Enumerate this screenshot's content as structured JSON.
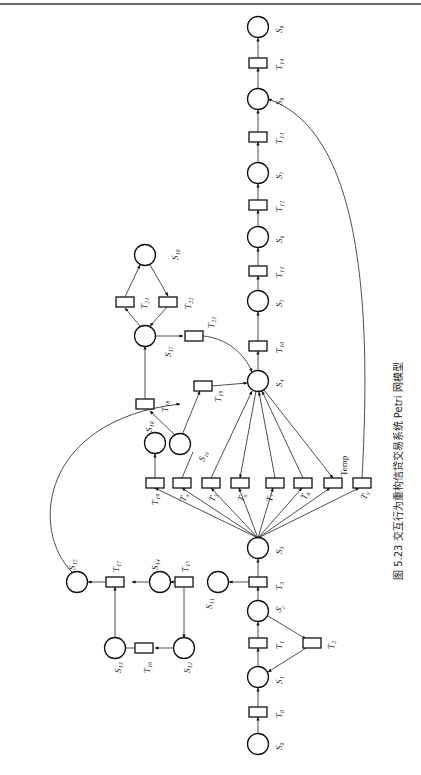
{
  "header": {
    "running_text": ""
  },
  "figure": {
    "caption": "图 5.23 交互行为重构信贷交易系统 Petri 网模型",
    "orientation": "rotated-90-ccw",
    "places": [
      {
        "id": "S0",
        "label": "S₀"
      },
      {
        "id": "S1",
        "label": "S₁"
      },
      {
        "id": "S2",
        "label": "S₂"
      },
      {
        "id": "S3",
        "label": "S₃"
      },
      {
        "id": "S4",
        "label": "S₄"
      },
      {
        "id": "S5",
        "label": "S₅"
      },
      {
        "id": "S6",
        "label": "S₆"
      },
      {
        "id": "S7",
        "label": "S₇"
      },
      {
        "id": "S8",
        "label": "S₈"
      },
      {
        "id": "S9",
        "label": "S₉"
      },
      {
        "id": "S10",
        "label": "S₁₀"
      },
      {
        "id": "S11",
        "label": "S₁₁"
      },
      {
        "id": "S12",
        "label": "S₁₂"
      },
      {
        "id": "S13",
        "label": "S₁₃"
      },
      {
        "id": "S14",
        "label": "S₁₄"
      },
      {
        "id": "S15",
        "label": "S₁₅"
      },
      {
        "id": "S16",
        "label": "S₁₆"
      },
      {
        "id": "S17",
        "label": "S₁₇"
      },
      {
        "id": "S18",
        "label": "S₁₈"
      }
    ],
    "transitions": [
      {
        "id": "T0",
        "label": "T₀"
      },
      {
        "id": "T1",
        "label": "T₁"
      },
      {
        "id": "T2",
        "label": "T₂"
      },
      {
        "id": "T3",
        "label": "T₃"
      },
      {
        "id": "T4",
        "label": "T₄"
      },
      {
        "id": "T5",
        "label": "T₅"
      },
      {
        "id": "T6",
        "label": "T₆"
      },
      {
        "id": "T7",
        "label": "T₇"
      },
      {
        "id": "T8",
        "label": "T₈"
      },
      {
        "id": "Temp",
        "label": "Temp"
      },
      {
        "id": "T9",
        "label": "T₉"
      },
      {
        "id": "T10",
        "label": "T₁₀"
      },
      {
        "id": "T11",
        "label": "T₁₁"
      },
      {
        "id": "T12",
        "label": "T₁₂"
      },
      {
        "id": "T13",
        "label": "T₁₃"
      },
      {
        "id": "T14",
        "label": "T₁₄"
      },
      {
        "id": "T15",
        "label": "T₁₅"
      },
      {
        "id": "T16",
        "label": "T₁₆"
      },
      {
        "id": "T17",
        "label": "T₁₇"
      },
      {
        "id": "T18",
        "label": "T₁₈"
      },
      {
        "id": "T19",
        "label": "T₁₉"
      },
      {
        "id": "T20",
        "label": "T₂₀"
      },
      {
        "id": "T21a",
        "label": "T₂₁"
      },
      {
        "id": "T21b",
        "label": "T₂₁"
      },
      {
        "id": "T22",
        "label": "T₂₂"
      }
    ],
    "arcs": [
      [
        "S0",
        "T0"
      ],
      [
        "T0",
        "S1"
      ],
      [
        "S1",
        "T1"
      ],
      [
        "T1",
        "S2"
      ],
      [
        "S2",
        "T2"
      ],
      [
        "T2",
        "S1"
      ],
      [
        "S2",
        "T3"
      ],
      [
        "T3",
        "S3"
      ],
      [
        "T3",
        "S11"
      ],
      [
        "S3",
        "T15"
      ],
      [
        "S3",
        "T4"
      ],
      [
        "S3",
        "T5"
      ],
      [
        "S3",
        "T6"
      ],
      [
        "S3",
        "T7"
      ],
      [
        "S3",
        "T8"
      ],
      [
        "S3",
        "Temp"
      ],
      [
        "S3",
        "T9"
      ],
      [
        "T15",
        "S10"
      ],
      [
        "S16",
        "T4"
      ],
      [
        "T5",
        "S4"
      ],
      [
        "S4",
        "T6"
      ],
      [
        "T7",
        "S4"
      ],
      [
        "T8",
        "S4"
      ],
      [
        "S4",
        "Temp"
      ],
      [
        "T9",
        "S8"
      ],
      [
        "S11",
        "T16"
      ],
      [
        "T16",
        "S14"
      ],
      [
        "T16",
        "S12"
      ],
      [
        "S12",
        "T17"
      ],
      [
        "T17",
        "S13"
      ],
      [
        "S13",
        "T18"
      ],
      [
        "S14",
        "T18"
      ],
      [
        "T18",
        "S15"
      ],
      [
        "S15",
        "T19"
      ],
      [
        "S16",
        "T19"
      ],
      [
        "S16",
        "T20"
      ],
      [
        "T20",
        "S4"
      ],
      [
        "T19",
        "S17"
      ],
      [
        "S17",
        "T21a"
      ],
      [
        "T21a",
        "S18"
      ],
      [
        "S18",
        "T22"
      ],
      [
        "T22",
        "S17"
      ],
      [
        "S17",
        "T21b"
      ],
      [
        "T21b",
        "S4"
      ],
      [
        "S4",
        "T10"
      ],
      [
        "T10",
        "S5"
      ],
      [
        "S5",
        "T11"
      ],
      [
        "T11",
        "S6"
      ],
      [
        "S6",
        "T12"
      ],
      [
        "T12",
        "S7"
      ],
      [
        "S7",
        "T13"
      ],
      [
        "T13",
        "S8"
      ],
      [
        "S8",
        "T14"
      ],
      [
        "T14",
        "S9"
      ]
    ]
  }
}
